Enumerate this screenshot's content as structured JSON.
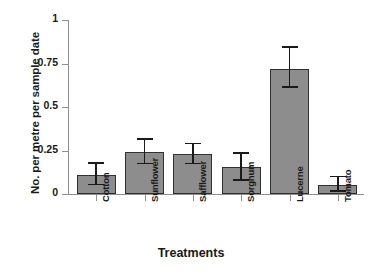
{
  "chart_data": {
    "type": "bar",
    "title": "",
    "xlabel": "Treatments",
    "ylabel": "No. per metre per sample date",
    "categories": [
      "Cotton",
      "Sunflower",
      "Safflower",
      "Sorghum",
      "Lucerne",
      "Tomato"
    ],
    "values": [
      0.11,
      0.24,
      0.23,
      0.155,
      0.72,
      0.05
    ],
    "error_upper": [
      0.175,
      0.31,
      0.285,
      0.23,
      0.84,
      0.095
    ],
    "error_lower": [
      0.05,
      0.17,
      0.17,
      0.075,
      0.61,
      0.01
    ],
    "ylim": [
      0,
      1
    ],
    "yticks": [
      0,
      0.25,
      0.5,
      0.75,
      1
    ],
    "ytick_labels": [
      "0",
      "0.25",
      "0.5",
      "0.75",
      "1"
    ],
    "grid": false,
    "legend": "none",
    "bar_color": "#8d8d8d",
    "bar_edge_color": "#303030",
    "axis_color": "#8f8f8f",
    "error_bar_color": "#1a1a1a",
    "background": "#ffffff"
  }
}
